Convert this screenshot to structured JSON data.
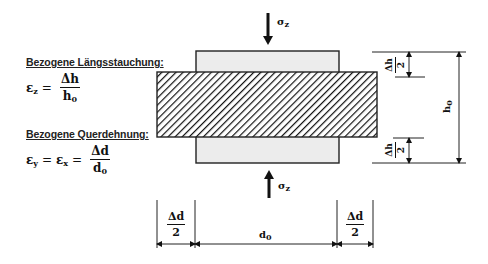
{
  "formulas": {
    "longitudinal": {
      "heading": "Bezogene Längsstauchung:",
      "lhs_symbol": "ε",
      "lhs_sub": "z",
      "equals": "=",
      "numerator": "Δh",
      "denominator_symbol": "h",
      "denominator_sub": "0"
    },
    "transverse": {
      "heading": "Bezogene Querdehnung:",
      "lhs1_symbol": "ε",
      "lhs1_sub": "y",
      "lhs2_symbol": "ε",
      "lhs2_sub": "x",
      "equals": "=",
      "numerator": "Δd",
      "denominator_symbol": "d",
      "denominator_sub": "0"
    }
  },
  "diagram": {
    "stress_top": {
      "symbol": "σ",
      "sub": "z"
    },
    "stress_bottom": {
      "symbol": "σ",
      "sub": "z"
    },
    "height_label": {
      "symbol": "h",
      "sub": "0"
    },
    "dh_top": {
      "numerator": "Δh",
      "denominator": "2"
    },
    "dh_bottom": {
      "numerator": "Δh",
      "denominator": "2"
    },
    "dd_left": {
      "numerator": "Δd",
      "denominator": "2"
    },
    "dd_right": {
      "numerator": "Δd",
      "denominator": "2"
    },
    "width_label": {
      "symbol": "d",
      "sub": "0"
    },
    "colors": {
      "original_block_fill": "#ececec",
      "outline": "#222222",
      "hatch": "#111111",
      "background": "#ffffff"
    }
  }
}
